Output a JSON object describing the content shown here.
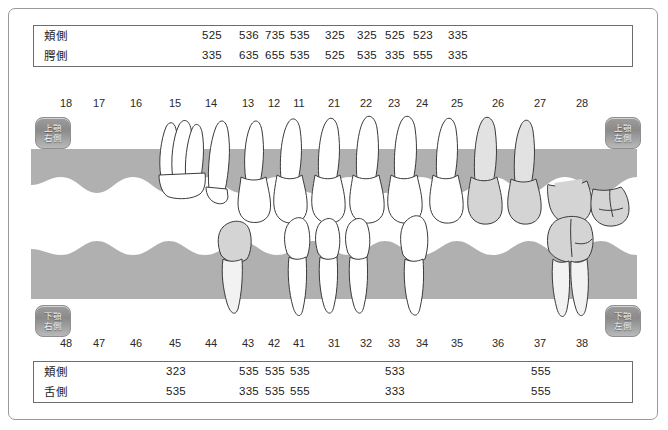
{
  "frame": {
    "border_color": "#9a9a9a",
    "background": "#ffffff"
  },
  "colors": {
    "gum": "#b0b0b0",
    "tooth_fill": "#ffffff",
    "tooth_outline": "#333333",
    "tooth_shaded": "#d9d9d9",
    "text": "#1b1b1b",
    "button_face": "#9d9d9d"
  },
  "quadrant_buttons": [
    {
      "name": "upper-right",
      "line1": "上顎",
      "line2": "右側"
    },
    {
      "name": "upper-left",
      "line1": "上顎",
      "line2": "左側"
    },
    {
      "name": "lower-right",
      "line1": "下顎",
      "line2": "右側"
    },
    {
      "name": "lower-left",
      "line1": "下顎",
      "line2": "左側"
    }
  ],
  "upper_arch": {
    "tooth_numbers": [
      "18",
      "17",
      "16",
      "15",
      "14",
      "13",
      "12",
      "11",
      "21",
      "22",
      "23",
      "24",
      "25",
      "26",
      "27",
      "28"
    ],
    "table": {
      "rows": [
        {
          "label": "頬側",
          "values": [
            "",
            "",
            "",
            "",
            "525",
            "536",
            "735",
            "535",
            "325",
            "325",
            "525",
            "523",
            "335",
            "",
            "",
            ""
          ]
        },
        {
          "label": "腭側",
          "values": [
            "",
            "",
            "",
            "",
            "335",
            "635",
            "655",
            "535",
            "525",
            "535",
            "335",
            "555",
            "335",
            "",
            "",
            ""
          ]
        }
      ]
    }
  },
  "lower_arch": {
    "tooth_numbers": [
      "48",
      "47",
      "46",
      "45",
      "44",
      "43",
      "42",
      "41",
      "31",
      "32",
      "33",
      "34",
      "35",
      "36",
      "37",
      "38"
    ],
    "table": {
      "rows": [
        {
          "label": "頬側",
          "values": [
            "",
            "",
            "",
            "323",
            "",
            "535",
            "535",
            "535",
            "",
            "",
            "533",
            "",
            "",
            "",
            "555",
            ""
          ]
        },
        {
          "label": "舌側",
          "values": [
            "",
            "",
            "",
            "535",
            "",
            "335",
            "535",
            "555",
            "",
            "",
            "333",
            "",
            "",
            "",
            "555",
            ""
          ]
        }
      ]
    }
  },
  "chart_data": {
    "type": "table",
    "upper_probing_depths": {
      "categories": [
        "14",
        "13",
        "12",
        "11",
        "21",
        "22",
        "23",
        "24",
        "25"
      ],
      "series": [
        {
          "name": "頬側",
          "values": [
            "525",
            "536",
            "735",
            "535",
            "325",
            "325",
            "525",
            "523",
            "335"
          ]
        },
        {
          "name": "腭側",
          "values": [
            "335",
            "635",
            "655",
            "535",
            "525",
            "535",
            "335",
            "555",
            "335"
          ]
        }
      ]
    },
    "lower_probing_depths": {
      "categories": [
        "45",
        "43",
        "42",
        "41",
        "33",
        "37"
      ],
      "series": [
        {
          "name": "頬側",
          "values": [
            "323",
            "535",
            "535",
            "535",
            "533",
            "555"
          ]
        },
        {
          "name": "舌側",
          "values": [
            "535",
            "335",
            "535",
            "555",
            "333",
            "555"
          ]
        }
      ]
    }
  }
}
